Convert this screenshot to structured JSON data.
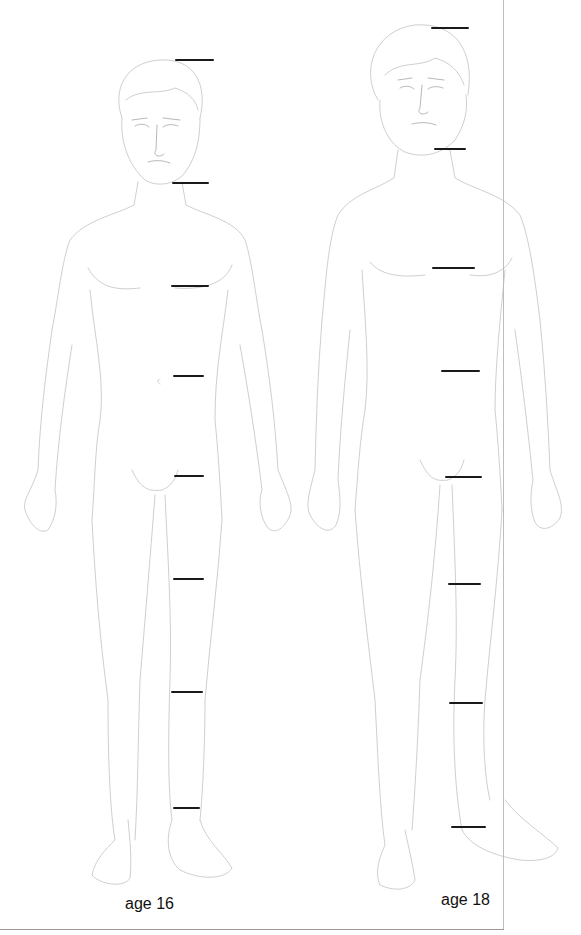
{
  "diagram": {
    "type": "figure-proportion-comparison",
    "line_color": "#1a1a1a",
    "sketch_color": "#cfcfcf",
    "figures": [
      {
        "id": "age-16",
        "label": "age 16",
        "label_pos": {
          "x": 125,
          "y": 895
        },
        "markers": [
          {
            "x1": 175,
            "x2": 214,
            "y": 60
          },
          {
            "x1": 172,
            "x2": 209,
            "y": 183
          },
          {
            "x1": 171,
            "x2": 209,
            "y": 286
          },
          {
            "x1": 173,
            "x2": 204,
            "y": 376
          },
          {
            "x1": 174,
            "x2": 204,
            "y": 476
          },
          {
            "x1": 173,
            "x2": 204,
            "y": 579
          },
          {
            "x1": 171,
            "x2": 203,
            "y": 692
          },
          {
            "x1": 173,
            "x2": 200,
            "y": 808
          }
        ]
      },
      {
        "id": "age-18",
        "label": "age 18",
        "label_pos": {
          "x": 441,
          "y": 891
        },
        "markers": [
          {
            "x1": 431,
            "x2": 469,
            "y": 28
          },
          {
            "x1": 434,
            "x2": 466,
            "y": 149
          },
          {
            "x1": 432,
            "x2": 475,
            "y": 268
          },
          {
            "x1": 441,
            "x2": 480,
            "y": 371
          },
          {
            "x1": 445,
            "x2": 482,
            "y": 477
          },
          {
            "x1": 448,
            "x2": 481,
            "y": 584
          },
          {
            "x1": 449,
            "x2": 483,
            "y": 703
          },
          {
            "x1": 451,
            "x2": 486,
            "y": 827
          }
        ]
      }
    ]
  }
}
